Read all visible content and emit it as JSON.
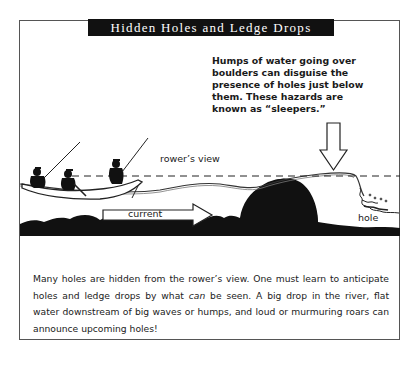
{
  "title": "Hidden Holes and Ledge Drops",
  "callout": {
    "lines": [
      "Humps of water going over",
      "boulders can disguise the",
      "presence of holes just below",
      "them. These hazards are",
      "known as “sleepers.”"
    ]
  },
  "labels": {
    "rowers_view": "rower’s view",
    "current": "current",
    "hole": "hole"
  },
  "caption": {
    "part1": "Many holes are hidden from the rower’s view. One must learn to anticipate holes and ledge drops by what ",
    "emphasis": "can",
    "part2": " be seen. A big drop in the river, flat water downstream of big waves or humps, and loud or murmuring roars can an­nounce upcoming holes!"
  },
  "colors": {
    "ink": "#111111",
    "frame": "#555555",
    "background": "#ffffff"
  }
}
